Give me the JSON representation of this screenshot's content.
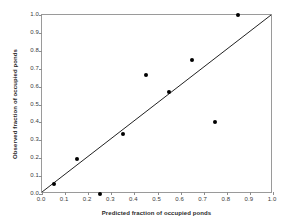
{
  "title_sliver": "",
  "chart_data": {
    "type": "scatter",
    "title": "",
    "xlabel": "Predicted fraction of occupied ponds",
    "ylabel": "Observed fraction of occupied ponds",
    "xlim": [
      0,
      1
    ],
    "ylim": [
      0,
      1
    ],
    "grid": false,
    "legend": null,
    "xticks": [
      "0.0",
      "0.1",
      "0.2",
      "0.3",
      "0.4",
      "0.5",
      "0.6",
      "0.7",
      "0.8",
      "0.9",
      "1.0"
    ],
    "yticks": [
      "0.0",
      "0.1",
      "0.2",
      "0.3",
      "0.4",
      "0.5",
      "0.6",
      "0.7",
      "0.8",
      "0.9",
      "1.0"
    ],
    "xtick_values": [
      0,
      0.1,
      0.2,
      0.3,
      0.4,
      0.5,
      0.6,
      0.7,
      0.8,
      0.9,
      1.0
    ],
    "ytick_values": [
      0,
      0.1,
      0.2,
      0.3,
      0.4,
      0.5,
      0.6,
      0.7,
      0.8,
      0.9,
      1.0
    ],
    "marker_color": "#000000",
    "marker_shape": "circle",
    "points": [
      {
        "x": 0.05,
        "y": 0.055
      },
      {
        "x": 0.15,
        "y": 0.193
      },
      {
        "x": 0.25,
        "y": 0.0
      },
      {
        "x": 0.35,
        "y": 0.335
      },
      {
        "x": 0.45,
        "y": 0.665
      },
      {
        "x": 0.55,
        "y": 0.57
      },
      {
        "x": 0.65,
        "y": 0.75
      },
      {
        "x": 0.75,
        "y": 0.4
      },
      {
        "x": 0.85,
        "y": 1.0
      }
    ],
    "reference_line": {
      "name": "one-to-one-line",
      "from": [
        0,
        0
      ],
      "to": [
        1,
        1
      ],
      "color": "#222222",
      "width": 1
    },
    "axis_color": "#9a9a9a"
  }
}
